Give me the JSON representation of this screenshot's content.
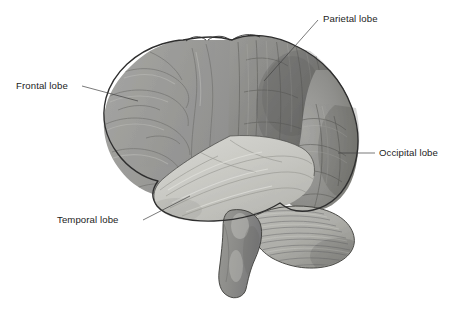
{
  "figure": {
    "background_color": "#ffffff",
    "width": 458,
    "height": 310,
    "style": "grayscale medical illustration"
  },
  "labels": [
    {
      "id": "frontal",
      "text": "Frontal lobe",
      "text_x": 16,
      "text_y": 89,
      "anchor": "start",
      "leader_path": "M 82 86 L 138 101",
      "target_structure": "frontal-lobe"
    },
    {
      "id": "parietal",
      "text": "Parietal lobe",
      "text_x": 323,
      "text_y": 22,
      "anchor": "start",
      "leader_path": "M 318 20 L 264 81",
      "target_structure": "parietal-lobe"
    },
    {
      "id": "occipital",
      "text": "Occipital lobe",
      "text_x": 379,
      "text_y": 156,
      "anchor": "start",
      "leader_path": "M 375 153 L 338 153",
      "target_structure": "occipital-lobe"
    },
    {
      "id": "temporal",
      "text": "Temporal lobe",
      "text_x": 57,
      "text_y": 223,
      "anchor": "start",
      "leader_path": "M 143 220 L 190 196",
      "target_structure": "temporal-lobe"
    }
  ],
  "structures": [
    {
      "id": "frontal-lobe",
      "name": "Frontal lobe",
      "fill": "#9d9d9a"
    },
    {
      "id": "parietal-lobe",
      "name": "Parietal lobe",
      "fill": "#8d8d8a"
    },
    {
      "id": "occipital-lobe",
      "name": "Occipital lobe",
      "fill": "#969693"
    },
    {
      "id": "temporal-lobe",
      "name": "Temporal lobe",
      "fill": "#c9c9c4"
    },
    {
      "id": "cerebellum",
      "name": "Cerebellum",
      "fill": "#b0b0ac"
    },
    {
      "id": "brainstem",
      "name": "Brainstem",
      "fill": "#8b8b88"
    }
  ],
  "colors": {
    "outline": "#2e2e2e",
    "sulci": "#6f6f6c",
    "gyri_highlight": "#b8b8b4",
    "label_text": "#1c1c1c",
    "leader_line": "#404040",
    "background": "#ffffff"
  }
}
